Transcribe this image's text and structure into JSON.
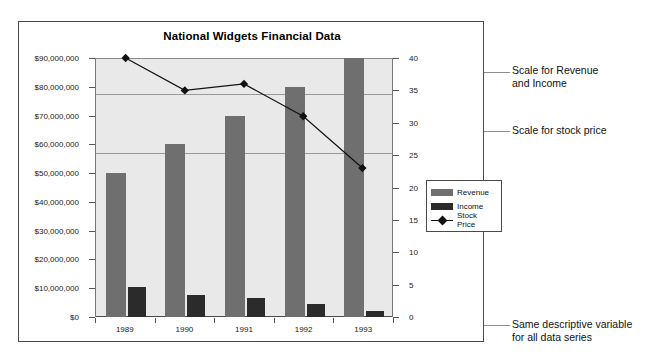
{
  "chart_data": {
    "type": "bar",
    "title": "National Widgets Financial Data",
    "xlabel": "",
    "ylabel": "",
    "categories": [
      "1989",
      "1990",
      "1991",
      "1992",
      "1993"
    ],
    "series": [
      {
        "name": "Revenue",
        "axis": "left",
        "values": [
          50000000,
          60000000,
          70000000,
          80000000,
          90000000
        ]
      },
      {
        "name": "Income",
        "axis": "left",
        "values": [
          10500000,
          7500000,
          6500000,
          4500000,
          2000000
        ]
      },
      {
        "name": "Stock Price",
        "axis": "right",
        "values": [
          40,
          35,
          36,
          31,
          23
        ]
      }
    ],
    "ylim": [
      0,
      90000000
    ],
    "y2lim": [
      0,
      40
    ],
    "yticks": [
      "$0",
      "$10,000,000",
      "$20,000,000",
      "$30,000,000",
      "$40,000,000",
      "$50,000,000",
      "$60,000,000",
      "$70,000,000",
      "$80,000,000",
      "$90,000,000"
    ],
    "ytick_values": [
      0,
      10000000,
      20000000,
      30000000,
      40000000,
      50000000,
      60000000,
      70000000,
      80000000,
      90000000
    ],
    "y2ticks": [
      "0",
      "5",
      "10",
      "15",
      "20",
      "25",
      "30",
      "35",
      "40"
    ],
    "y2tick_values": [
      0,
      5,
      10,
      15,
      20,
      25,
      30,
      35,
      40
    ],
    "grid": false,
    "legend_position": "right-inside",
    "colors": {
      "revenue": "#6f6f6f",
      "income": "#2b2b2b",
      "stock_price": "#111111",
      "plot_background": "#e9e9e9",
      "frame": "#4a4a4a"
    },
    "annotations": [
      {
        "id": "scale-revenue-income",
        "text": "Scale for Revenue\nand Income"
      },
      {
        "id": "scale-stock-price",
        "text": "Scale for stock price"
      },
      {
        "id": "same-descriptive-variable",
        "text": "Same descriptive variable\nfor all data series"
      }
    ]
  },
  "legend": {
    "items": [
      {
        "label": "Revenue"
      },
      {
        "label": "Income"
      },
      {
        "label": "Stock Price"
      }
    ]
  }
}
